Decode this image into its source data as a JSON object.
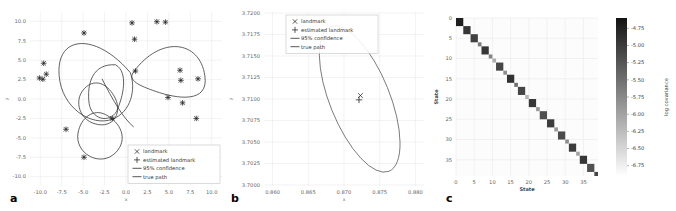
{
  "figure": {
    "panel_labels": {
      "a": "a",
      "b": "b",
      "c": "c"
    }
  },
  "legend": {
    "items": [
      {
        "label": "landmark",
        "marker": "x-marker"
      },
      {
        "label": "estimated landmark",
        "marker": "plus-marker"
      },
      {
        "label": "95% confidence",
        "marker": "line-swatch"
      },
      {
        "label": "true path",
        "marker": "line-swatch"
      }
    ]
  },
  "chart_data": [
    {
      "id": "panel-a",
      "type": "scatter",
      "title": "",
      "xlabel": "x",
      "ylabel": "y",
      "xlim": [
        -11.2,
        11.2
      ],
      "ylim": [
        -11.2,
        11.2
      ],
      "xticks": [
        "-10.0",
        "-7.5",
        "-5.0",
        "-2.5",
        "0.0",
        "2.5",
        "5.0",
        "7.5",
        "10.0"
      ],
      "yticks": [
        "10.0",
        "7.5",
        "5.0",
        "2.5",
        "0.0",
        "-2.5",
        "-5.0",
        "-7.5",
        "-10.0"
      ],
      "xtick_values": [
        -10.0,
        -7.5,
        -5.0,
        -2.5,
        0.0,
        2.5,
        5.0,
        7.5,
        10.0
      ],
      "ytick_values": [
        10.0,
        7.5,
        5.0,
        2.5,
        0.0,
        -2.5,
        -5.0,
        -7.5,
        -10.0
      ],
      "grid": true,
      "legend_position": "lower-right",
      "landmarks": [
        [
          -9.6,
          4.6
        ],
        [
          -10.1,
          2.7
        ],
        [
          -9.7,
          2.55
        ],
        [
          -9.3,
          3.2
        ],
        [
          -4.9,
          8.5
        ],
        [
          0.7,
          9.8
        ],
        [
          1.0,
          7.7
        ],
        [
          4.6,
          9.9
        ],
        [
          3.6,
          9.95
        ],
        [
          1.1,
          3.6
        ],
        [
          6.3,
          3.7
        ],
        [
          6.4,
          2.4
        ],
        [
          8.4,
          2.6
        ],
        [
          4.9,
          0.2
        ],
        [
          6.6,
          -0.5
        ],
        [
          8.2,
          -2.5
        ],
        [
          -7.0,
          -3.9
        ],
        [
          -1.6,
          -2.5
        ],
        [
          -4.9,
          -7.5
        ]
      ],
      "estimated_landmarks": [
        [
          -9.6,
          4.6
        ],
        [
          -10.1,
          2.7
        ],
        [
          -9.7,
          2.55
        ],
        [
          -9.3,
          3.2
        ],
        [
          -4.9,
          8.5
        ],
        [
          0.7,
          9.8
        ],
        [
          1.0,
          7.7
        ],
        [
          4.6,
          9.9
        ],
        [
          3.6,
          9.95
        ],
        [
          1.1,
          3.6
        ],
        [
          6.3,
          3.7
        ],
        [
          6.4,
          2.4
        ],
        [
          8.4,
          2.6
        ],
        [
          4.9,
          0.2
        ],
        [
          6.6,
          -0.5
        ],
        [
          8.2,
          -2.5
        ],
        [
          -7.0,
          -3.9
        ],
        [
          -1.6,
          -2.5
        ],
        [
          -4.9,
          -7.5
        ]
      ]
    },
    {
      "id": "panel-b",
      "type": "scatter",
      "title": "",
      "xlabel": "x",
      "ylabel": "y",
      "xlim": [
        0.8588,
        0.8812
      ],
      "ylim": [
        3.69988,
        3.72012
      ],
      "xticks": [
        "0.860",
        "0.865",
        "0.870",
        "0.875",
        "0.880"
      ],
      "yticks": [
        "3.7200",
        "3.7175",
        "3.7150",
        "3.7125",
        "3.7100",
        "3.7075",
        "3.7050",
        "3.7025",
        "3.7000"
      ],
      "xtick_values": [
        0.86,
        0.865,
        0.87,
        0.875,
        0.88
      ],
      "ytick_values": [
        3.72,
        3.7175,
        3.715,
        3.7125,
        3.71,
        3.7075,
        3.705,
        3.7025,
        3.7
      ],
      "grid": true,
      "legend_position": "upper-left",
      "landmark": [
        0.8723,
        3.7104
      ],
      "estimated_landmark": [
        0.8721,
        3.7099
      ],
      "confidence_ellipse": {
        "center_x": 0.8722,
        "center_y": 3.71,
        "semi_major": 0.0088,
        "semi_minor": 0.0026,
        "angle_deg": -62
      }
    },
    {
      "id": "panel-c",
      "type": "heatmap",
      "title": "",
      "xlabel": "State",
      "ylabel": "State",
      "xticks": [
        "0",
        "5",
        "10",
        "15",
        "20",
        "25",
        "30",
        "35"
      ],
      "yticks": [
        "0",
        "5",
        "10",
        "15",
        "20",
        "25",
        "30",
        "35"
      ],
      "xtick_values": [
        0,
        5,
        10,
        15,
        20,
        25,
        30,
        35
      ],
      "ytick_values": [
        0,
        5,
        10,
        15,
        20,
        25,
        30,
        35
      ],
      "n_states": 39,
      "grid": true,
      "colorbar": {
        "label": "log covariance",
        "ticks": [
          "-4.75",
          "-5.00",
          "-5.25",
          "-5.50",
          "-5.75",
          "-6.00",
          "-6.25",
          "-6.50",
          "-6.75"
        ],
        "tick_values": [
          -4.75,
          -5.0,
          -5.25,
          -5.5,
          -5.75,
          -6.0,
          -6.25,
          -6.5,
          -6.75
        ],
        "vmin": -6.9,
        "vmax": -4.6,
        "colormap": "grayscale-reversed"
      },
      "diagonal_blocks": [
        {
          "start": 0,
          "size": 2,
          "value": -4.72
        },
        {
          "start": 2,
          "size": 2,
          "value": -4.95
        },
        {
          "start": 4,
          "size": 2,
          "value": -5.05
        },
        {
          "start": 6,
          "size": 1,
          "value": -5.6
        },
        {
          "start": 7,
          "size": 2,
          "value": -4.95
        },
        {
          "start": 9,
          "size": 1,
          "value": -5.7
        },
        {
          "start": 10,
          "size": 1,
          "value": -6.1
        },
        {
          "start": 11,
          "size": 2,
          "value": -5.1
        },
        {
          "start": 13,
          "size": 1,
          "value": -5.8
        },
        {
          "start": 14,
          "size": 2,
          "value": -4.9
        },
        {
          "start": 16,
          "size": 1,
          "value": -5.5
        },
        {
          "start": 17,
          "size": 2,
          "value": -5.1
        },
        {
          "start": 19,
          "size": 1,
          "value": -6.2
        },
        {
          "start": 20,
          "size": 2,
          "value": -4.95
        },
        {
          "start": 22,
          "size": 1,
          "value": -5.9
        },
        {
          "start": 23,
          "size": 2,
          "value": -5.2
        },
        {
          "start": 25,
          "size": 2,
          "value": -5.0
        },
        {
          "start": 27,
          "size": 1,
          "value": -5.9
        },
        {
          "start": 28,
          "size": 2,
          "value": -5.15
        },
        {
          "start": 30,
          "size": 1,
          "value": -5.8
        },
        {
          "start": 31,
          "size": 2,
          "value": -5.0
        },
        {
          "start": 33,
          "size": 1,
          "value": -6.0
        },
        {
          "start": 34,
          "size": 2,
          "value": -4.95
        },
        {
          "start": 36,
          "size": 2,
          "value": -5.2
        },
        {
          "start": 38,
          "size": 1,
          "value": -5.1
        }
      ]
    }
  ]
}
